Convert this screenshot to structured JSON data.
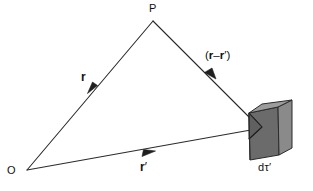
{
  "figure": {
    "background_color": "#ffffff",
    "stroke_color": "#2b2b2b",
    "text_color": "#111111"
  },
  "labels": {
    "point_P": "P",
    "origin_O": "O",
    "vector_r": "r",
    "vector_r_prime_text": "r",
    "vector_r_prime_mark": "′",
    "separation_open": "(",
    "separation_r": "r",
    "separation_minus": "–",
    "separation_r2": "r",
    "separation_prime": "′",
    "separation_close": ")",
    "volume_element_d": "d",
    "volume_element_tau": "τ",
    "volume_element_prime": "′"
  },
  "geometry": {
    "point_P": {
      "x": 153,
      "y": 21
    },
    "origin_O": {
      "x": 27,
      "y": 170
    },
    "source_point": {
      "x": 258,
      "y": 128
    },
    "vector_r_arrowhead": {
      "x": 96,
      "y": 88
    },
    "vector_r_prime_arrowhead": {
      "x": 150,
      "y": 153
    },
    "separation_arrowhead": {
      "x": 207,
      "y": 76
    }
  },
  "cube": {
    "name": "differential-volume-element",
    "top_face_color": "#9c9c9c",
    "front_face_color": "#6b6b6b",
    "right_face_color": "#8a8a8a",
    "notch_face_color": "#585858",
    "edge_color": "#2b2b2b"
  },
  "colors": {
    "ink": "#2b2b2b",
    "paper": "#ffffff"
  }
}
